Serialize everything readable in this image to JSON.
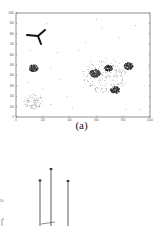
{
  "chart_data": [
    {
      "type": "scatter",
      "panel": "a",
      "title": "",
      "caption": "(a)",
      "xlabel": "",
      "ylabel": "",
      "xlim": [
        0,
        1000
      ],
      "ylim": [
        0,
        1000
      ],
      "xticks": [
        "0",
        "100",
        "200",
        "300",
        "400",
        "500",
        "600",
        "700",
        "800",
        "900",
        "1000"
      ],
      "yticks": [
        "0",
        "100",
        "200",
        "300",
        "400",
        "500",
        "600",
        "700",
        "800",
        "900",
        "1000"
      ],
      "grid": false,
      "annotations": [
        "three-armed glyph near (130, 770)"
      ],
      "clusters": [
        {
          "name": "dense-left",
          "center": [
            130,
            470
          ],
          "radius": 35,
          "density": "high"
        },
        {
          "name": "sparse-left",
          "center": [
            130,
            150
          ],
          "radius": 75,
          "density": "low"
        },
        {
          "name": "sparse-right-halo",
          "center": [
            660,
            400
          ],
          "radius": 170,
          "density": "low"
        },
        {
          "name": "dense-right-1",
          "center": [
            590,
            420
          ],
          "radius": 40,
          "density": "high"
        },
        {
          "name": "dense-right-2",
          "center": [
            690,
            470
          ],
          "radius": 30,
          "density": "high"
        },
        {
          "name": "dense-right-3",
          "center": [
            840,
            490
          ],
          "radius": 35,
          "density": "high"
        },
        {
          "name": "dense-right-4",
          "center": [
            740,
            260
          ],
          "radius": 35,
          "density": "high"
        }
      ],
      "noise_points": [
        [
          230,
          900
        ],
        [
          600,
          940
        ],
        [
          470,
          640
        ],
        [
          640,
          860
        ],
        [
          520,
          720
        ],
        [
          770,
          760
        ],
        [
          890,
          880
        ],
        [
          990,
          480
        ],
        [
          310,
          620
        ],
        [
          110,
          640
        ],
        [
          260,
          470
        ],
        [
          330,
          360
        ],
        [
          960,
          300
        ],
        [
          380,
          200
        ],
        [
          500,
          280
        ],
        [
          260,
          120
        ],
        [
          420,
          90
        ],
        [
          820,
          70
        ],
        [
          930,
          70
        ],
        [
          90,
          330
        ],
        [
          200,
          270
        ]
      ]
    },
    {
      "type": "bar",
      "panel": "b",
      "title": "",
      "caption": "",
      "xlabel": "",
      "ylabel": "",
      "description": "stem plot with three tall stems (partially visible, cropped)",
      "stems": [
        {
          "x": 40,
          "height_rel": 0.8
        },
        {
          "x": 51,
          "height_rel": 1.0
        },
        {
          "x": 68,
          "height_rel": 0.79
        }
      ]
    }
  ],
  "figure": {
    "caption_a": "(a)"
  }
}
